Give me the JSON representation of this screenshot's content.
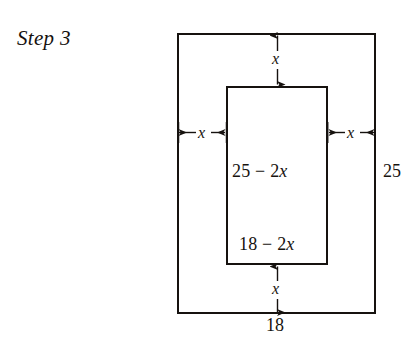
{
  "figure": {
    "caption": "Step 3",
    "background_color": "#ffffff",
    "line_color": "#16120f",
    "outer_rectangle": {
      "name": "outer-rectangle",
      "width_label": "18",
      "height_label": "25"
    },
    "inner_rectangle": {
      "name": "inner-rectangle",
      "width_label": "18 − 2x",
      "width_label_parts": {
        "lead": "18 − 2",
        "var": "x"
      },
      "height_label": "25 − 2x",
      "height_label_parts": {
        "lead": "25 − 2",
        "var": "x"
      }
    },
    "margins": {
      "top": "x",
      "bottom": "x",
      "left": "x",
      "right": "x"
    },
    "arrows": {
      "top": "double-headed-vertical-arrow",
      "bottom": "double-headed-vertical-arrow",
      "left": "double-headed-horizontal-arrow",
      "right": "double-headed-horizontal-arrow"
    }
  }
}
